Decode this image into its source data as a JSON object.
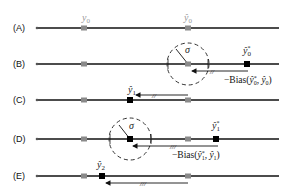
{
  "diagram": {
    "rows": [
      {
        "label": "(A)",
        "y": 28
      },
      {
        "label": "(B)",
        "y": 64
      },
      {
        "label": "(C)",
        "y": 100
      },
      {
        "label": "(D)",
        "y": 139
      },
      {
        "label": "(E)",
        "y": 176
      }
    ],
    "labels": {
      "y0": "y0",
      "yhat0": "ŷ0",
      "yhat0_star": "ŷ0*",
      "yhat1": "ŷ1",
      "yhat1_star": "ŷ1*",
      "yhat2": "ŷ2",
      "sigma": "σ",
      "bias0": "−Bias(ŷ0*, ŷ0)",
      "bias1": "−Bias(ŷ1*, ŷ1)"
    },
    "colors": {
      "line": "#111111",
      "gray_marker": "#8a8a8a",
      "black_marker": "#000000",
      "gray_text": "#9a9a9a"
    }
  }
}
